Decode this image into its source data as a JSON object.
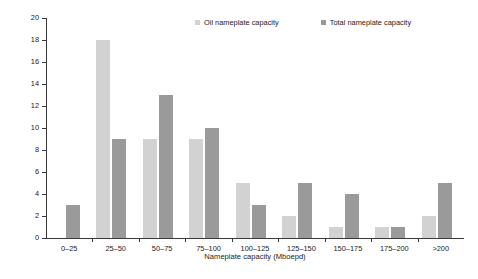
{
  "chart_data": {
    "type": "bar",
    "title": "",
    "xlabel": "Nameplate capacity (Mboepd)",
    "ylabel": "Number of structures",
    "categories": [
      "0–25",
      "25–50",
      "50–75",
      "75–100",
      "100–125",
      "125–150",
      "150–175",
      "175–200",
      ">200"
    ],
    "series": [
      {
        "name": "Oil nameplate capacity",
        "color": "#d2d2d2",
        "values": [
          0,
          18,
          9,
          9,
          5,
          2,
          1,
          1,
          2
        ]
      },
      {
        "name": "Total nameplate capacity",
        "color": "#9a9a9a",
        "values": [
          3,
          9,
          13,
          10,
          3,
          5,
          4,
          1,
          5
        ]
      }
    ],
    "ylim": [
      0,
      20
    ],
    "yticks": [
      0,
      2,
      4,
      6,
      8,
      10,
      12,
      14,
      16,
      18,
      20
    ],
    "ytick_labels": [
      "0",
      "2",
      "4",
      "6",
      "8",
      "10",
      "12",
      "14",
      "16",
      "18",
      "20"
    ],
    "grid": false,
    "legend_position": "top-right"
  },
  "legend": {
    "items": [
      {
        "label": "Oil nameplate capacity",
        "color": "#d2d2d2"
      },
      {
        "label": "Total nameplate capacity",
        "color": "#9a9a9a"
      }
    ]
  },
  "axes": {
    "y_title": "Number of structures",
    "x_title": "Nameplate capacity (Mboepd)"
  }
}
